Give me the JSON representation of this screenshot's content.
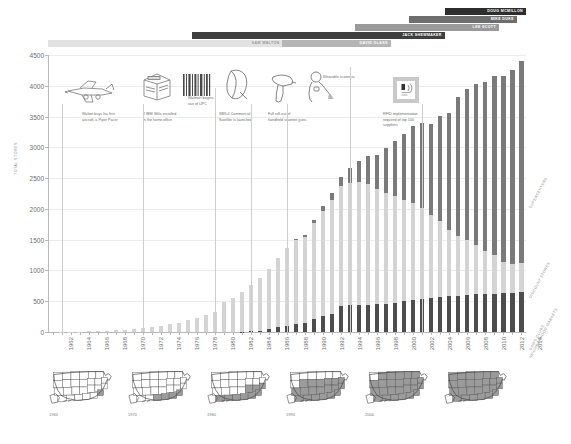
{
  "chart_data": {
    "type": "bar",
    "xlabel": "",
    "ylabel": "TOTAL STORES",
    "ylim": [
      0,
      4500
    ],
    "ytick_step": 500,
    "yticks": [
      0,
      500,
      1000,
      1500,
      2000,
      2500,
      3000,
      3500,
      4000,
      4500
    ],
    "grid": true,
    "legend_position": "right-rotated",
    "stacked": true,
    "x": [
      1962,
      1963,
      1964,
      1965,
      1966,
      1967,
      1968,
      1969,
      1970,
      1971,
      1972,
      1973,
      1974,
      1975,
      1976,
      1977,
      1978,
      1979,
      1980,
      1981,
      1982,
      1983,
      1984,
      1985,
      1986,
      1987,
      1988,
      1989,
      1990,
      1991,
      1992,
      1993,
      1994,
      1995,
      1996,
      1997,
      1998,
      1999,
      2000,
      2001,
      2002,
      2003,
      2004,
      2005,
      2006,
      2007,
      2008,
      2009,
      2010,
      2011,
      2012,
      2013,
      2014
    ],
    "xtick_labels": [
      "1962",
      "1964",
      "1966",
      "1968",
      "1970",
      "1972",
      "1974",
      "1976",
      "1978",
      "1980",
      "1982",
      "1984",
      "1986",
      "1988",
      "1990",
      "1992",
      "1994",
      "1996",
      "1998",
      "2000",
      "2002",
      "2004",
      "2006",
      "2008",
      "2010",
      "2012",
      "2014"
    ],
    "series": [
      {
        "name": "SAM'S CLUBS / NEIGHBORHOOD MARKETS",
        "color": "#4d4d4d",
        "values": [
          0,
          0,
          0,
          0,
          0,
          0,
          0,
          0,
          0,
          0,
          0,
          0,
          0,
          0,
          0,
          0,
          0,
          0,
          0,
          0,
          0,
          3,
          11,
          23,
          49,
          84,
          105,
          123,
          148,
          208,
          256,
          289,
          417,
          433,
          436,
          443,
          451,
          463,
          475,
          500,
          525,
          538,
          551,
          567,
          579,
          591,
          602,
          611,
          613,
          620,
          626,
          632,
          647
        ]
      },
      {
        "name": "DISCOUNT STORES",
        "color": "#d4d4d4",
        "values": [
          1,
          2,
          5,
          8,
          14,
          19,
          24,
          32,
          38,
          51,
          64,
          78,
          98,
          125,
          153,
          190,
          229,
          276,
          330,
          491,
          551,
          642,
          745,
          859,
          980,
          1114,
          1259,
          1364,
          1399,
          1568,
          1714,
          1848,
          1950,
          1985,
          1995,
          1960,
          1869,
          1801,
          1736,
          1647,
          1568,
          1478,
          1353,
          1234,
          1075,
          971,
          891,
          803,
          708,
          629,
          508,
          466,
          470
        ]
      },
      {
        "name": "SUPERCENTERS",
        "color": "#7a7a7a",
        "values": [
          0,
          0,
          0,
          0,
          0,
          0,
          0,
          0,
          0,
          0,
          0,
          0,
          0,
          0,
          0,
          0,
          0,
          0,
          0,
          0,
          0,
          0,
          0,
          0,
          0,
          0,
          6,
          20,
          30,
          50,
          72,
          117,
          159,
          239,
          344,
          454,
          564,
          721,
          888,
          1066,
          1258,
          1386,
          1471,
          1713,
          1906,
          2256,
          2447,
          2612,
          2747,
          2907,
          3029,
          3158,
          3288
        ]
      }
    ],
    "category_labels": [
      {
        "text": "SUPERCENTERS"
      },
      {
        "text": "DISCOUNT STORES"
      },
      {
        "text": "SAM'S CLUBS"
      },
      {
        "text": "NEIGHBORHOOD MARKETS"
      }
    ]
  },
  "ceos": [
    {
      "name": "SAM WALTON",
      "start": 1962,
      "end": 1988,
      "color": "#e2e2e2",
      "text_color": "#9a9a9a",
      "row": 4
    },
    {
      "name": "DAVID GLASS",
      "start": 1988,
      "end": 2000,
      "color": "#b5b5b5",
      "text_color": "#ffffff",
      "row": 4
    },
    {
      "name": "JACK SHEWMAKER",
      "start": 1978,
      "end": 2006,
      "color": "#3f3f3f",
      "text_color": "#ffffff",
      "row": 3
    },
    {
      "name": "LEE SCOTT",
      "start": 1996,
      "end": 2012,
      "color": "#9a9a9a",
      "text_color": "#ffffff",
      "row": 2
    },
    {
      "name": "MIKE DUKE",
      "start": 2002,
      "end": 2014,
      "color": "#6e6e6e",
      "text_color": "#ffffff",
      "row": 1
    },
    {
      "name": "DOUG MCMILLON",
      "start": 2006,
      "end": 2015,
      "color": "#2e2e2e",
      "text_color": "#ffffff",
      "row": 0
    }
  ],
  "annotations": [
    {
      "icon": "airplane-icon",
      "caption": "Walton buys his first\naircraft, a Piper Pacer",
      "year": 1963
    },
    {
      "icon": "mainframe-icon",
      "caption": "2 IBM 360s installed\nin the home office",
      "year": 1972
    },
    {
      "icon": "barcode-icon",
      "caption": "Walmart begins\nuse of UPC",
      "year": 1980
    },
    {
      "icon": "satellite-icon",
      "caption": "SBS-4 Commercial\nSatellite is launched",
      "year": 1984
    },
    {
      "icon": "scanner-gun-icon",
      "caption": "Full roll-out of\nhandheld scanner guns",
      "year": 1988
    },
    {
      "icon": "wearable-scanner-icon",
      "caption": "Wearable scanners",
      "year": 1995
    },
    {
      "icon": "rfid-tag-icon",
      "caption": "RFID implementation\nrequired of top 100 suppliers",
      "year": 2003
    }
  ],
  "maps": [
    {
      "year": "1960",
      "fill_ratio": 0.04
    },
    {
      "year": "1970",
      "fill_ratio": 0.16
    },
    {
      "year": "1980",
      "fill_ratio": 0.34
    },
    {
      "year": "1990",
      "fill_ratio": 0.72
    },
    {
      "year": "2000",
      "fill_ratio": 0.97
    },
    {
      "year": "",
      "fill_ratio": 1.0
    }
  ]
}
